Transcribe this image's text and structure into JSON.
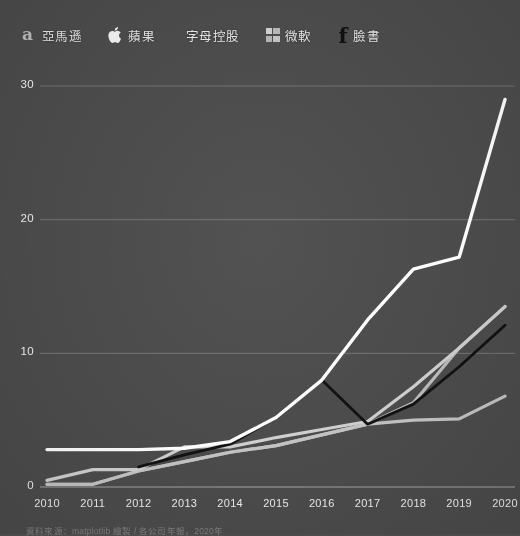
{
  "legend": {
    "items": [
      {
        "label": "亞馬遜",
        "icon": "amazon-logo-icon",
        "color": "#ffffff"
      },
      {
        "label": "蘋果",
        "icon": "apple-logo-icon",
        "color": "#d8d8d8"
      },
      {
        "label": "字母控股",
        "icon": "none",
        "color": "#b3b3b3"
      },
      {
        "label": "微軟",
        "icon": "microsoft-logo-icon",
        "color": "#c0c0c0"
      },
      {
        "label": "臉書",
        "icon": "facebook-logo-icon",
        "color": "#111111"
      }
    ]
  },
  "caption": "資料來源：matplotlib 繪製 / 各公司年報，2020年",
  "chart_data": {
    "type": "line",
    "title": "",
    "xlabel": "",
    "ylabel": "",
    "x": [
      2010,
      2011,
      2012,
      2013,
      2014,
      2015,
      2016,
      2017,
      2018,
      2019,
      2020
    ],
    "xticklabels": [
      "2010",
      "2011",
      "2012",
      "2013",
      "2014",
      "2015",
      "2016",
      "2017",
      "2018",
      "2019",
      "2020"
    ],
    "yticks": [
      0,
      10,
      20,
      30
    ],
    "yticklabels": [
      "0",
      "10",
      "20",
      "30"
    ],
    "xlim": [
      2010,
      2020
    ],
    "ylim": [
      0,
      31.5
    ],
    "grid": "horizontal",
    "legend_position": "top",
    "background_color": "#4c4c4c",
    "series": [
      {
        "name": "亞馬遜",
        "color": "#ffffff",
        "width": 3.4,
        "values": [
          2.8,
          2.8,
          2.8,
          2.9,
          3.4,
          5.2,
          8.0,
          12.5,
          16.3,
          17.2,
          29.0
        ]
      },
      {
        "name": "蘋果",
        "color": "#d0d0d0",
        "width": 3.2,
        "values": [
          0.5,
          1.3,
          1.3,
          3.0,
          3.0,
          3.7,
          4.3,
          4.9,
          7.5,
          10.4,
          13.5
        ]
      },
      {
        "name": "字母控股",
        "color": "#bdbdbd",
        "width": 3.2,
        "values": [
          0.2,
          0.2,
          1.2,
          1.9,
          2.6,
          3.1,
          3.9,
          4.7,
          6.3,
          10.4,
          13.5
        ]
      },
      {
        "name": "微軟",
        "color": "#c4c4c4",
        "width": 3.2,
        "values": [
          0.2,
          0.2,
          1.2,
          1.9,
          2.6,
          3.1,
          3.9,
          4.7,
          5.0,
          5.1,
          6.8
        ]
      },
      {
        "name": "臉書",
        "color": "#121212",
        "width": 2.8,
        "values": [
          null,
          null,
          1.5,
          2.4,
          3.2,
          5.2,
          8.0,
          4.7,
          6.2,
          9.0,
          12.1
        ]
      }
    ]
  }
}
